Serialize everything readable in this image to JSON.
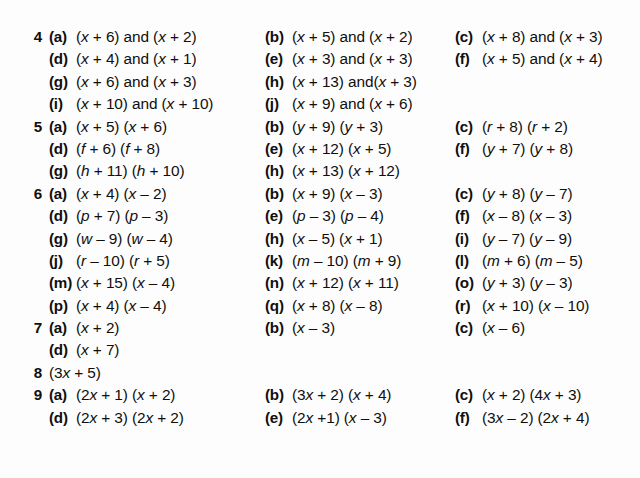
{
  "page": {
    "background": "#fdfdfd",
    "text_color": "#100f0d"
  },
  "rows": [
    {
      "number": "4",
      "cells": [
        {
          "col": 1,
          "label": "(a)",
          "expr": "(x + 6) and (x + 2)"
        },
        {
          "col": 2,
          "label": "(b)",
          "expr": "(x + 5) and (x + 2)"
        },
        {
          "col": 3,
          "label": "(c)",
          "expr": "(x + 8) and (x + 3)"
        }
      ]
    },
    {
      "number": "",
      "cells": [
        {
          "col": 1,
          "label": "(d)",
          "expr": "(x + 4) and (x + 1)"
        },
        {
          "col": 2,
          "label": "(e)",
          "expr": "(x + 3) and (x + 3)"
        },
        {
          "col": 3,
          "label": "(f)",
          "expr": "(x + 5) and (x + 4)"
        }
      ]
    },
    {
      "number": "",
      "cells": [
        {
          "col": 1,
          "label": "(g)",
          "expr": "(x + 6) and (x + 3)"
        },
        {
          "col": 2,
          "label": "(h)",
          "expr": "(x + 13) and(x + 3)"
        }
      ]
    },
    {
      "number": "",
      "cells": [
        {
          "col": 1,
          "label": "(i)",
          "expr": "(x + 10) and (x + 10)"
        },
        {
          "col": 2,
          "label": "(j)",
          "expr": "(x + 9) and (x + 6)"
        }
      ]
    },
    {
      "number": "5",
      "cells": [
        {
          "col": 1,
          "label": "(a)",
          "expr": "(x + 5) (x + 6)"
        },
        {
          "col": 2,
          "label": "(b)",
          "expr": "(y + 9) (y + 3)"
        },
        {
          "col": 3,
          "label": "(c)",
          "expr": "(r + 8) (r + 2)"
        }
      ]
    },
    {
      "number": "",
      "cells": [
        {
          "col": 1,
          "label": "(d)",
          "expr": "(f + 6) (f + 8)"
        },
        {
          "col": 2,
          "label": "(e)",
          "expr": "(x + 12) (x + 5)"
        },
        {
          "col": 3,
          "label": "(f)",
          "expr": "(y + 7) (y + 8)"
        }
      ]
    },
    {
      "number": "",
      "cells": [
        {
          "col": 1,
          "label": "(g)",
          "expr": "(h + 11) (h + 10)"
        },
        {
          "col": 2,
          "label": "(h)",
          "expr": "(x + 13) (x + 12)"
        }
      ]
    },
    {
      "number": "6",
      "cells": [
        {
          "col": 1,
          "label": "(a)",
          "expr": "(x + 4) (x – 2)"
        },
        {
          "col": 2,
          "label": "(b)",
          "expr": "(x + 9) (x – 3)"
        },
        {
          "col": 3,
          "label": "(c)",
          "expr": "(y + 8) (y – 7)"
        }
      ]
    },
    {
      "number": "",
      "cells": [
        {
          "col": 1,
          "label": "(d)",
          "expr": "(p + 7) (p – 3)"
        },
        {
          "col": 2,
          "label": "(e)",
          "expr": "(p – 3) (p – 4)"
        },
        {
          "col": 3,
          "label": "(f)",
          "expr": "(x – 8) (x – 3)"
        }
      ]
    },
    {
      "number": "",
      "cells": [
        {
          "col": 1,
          "label": "(g)",
          "expr": "(w – 9) (w – 4)"
        },
        {
          "col": 2,
          "label": "(h)",
          "expr": "(x – 5) (x + 1)"
        },
        {
          "col": 3,
          "label": "(i)",
          "expr": "(y – 7) (y – 9)"
        }
      ]
    },
    {
      "number": "",
      "cells": [
        {
          "col": 1,
          "label": "(j)",
          "expr": "(r – 10) (r + 5)"
        },
        {
          "col": 2,
          "label": "(k)",
          "expr": "(m – 10) (m + 9)"
        },
        {
          "col": 3,
          "label": "(l)",
          "expr": "(m + 6) (m – 5)"
        }
      ]
    },
    {
      "number": "",
      "cells": [
        {
          "col": 1,
          "label": "(m)",
          "expr": "(x + 15) (x – 4)"
        },
        {
          "col": 2,
          "label": "(n)",
          "expr": "(x + 12) (x + 11)"
        },
        {
          "col": 3,
          "label": "(o)",
          "expr": "(y + 3) (y – 3)"
        }
      ]
    },
    {
      "number": "",
      "cells": [
        {
          "col": 1,
          "label": "(p)",
          "expr": "(x + 4) (x – 4)"
        },
        {
          "col": 2,
          "label": "(q)",
          "expr": "(x + 8) (x – 8)"
        },
        {
          "col": 3,
          "label": "(r)",
          "expr": "(x + 10) (x – 10)"
        }
      ]
    },
    {
      "number": "7",
      "cells": [
        {
          "col": 1,
          "label": "(a)",
          "expr": "(x + 2)"
        },
        {
          "col": 2,
          "label": "(b)",
          "expr": "(x – 3)"
        },
        {
          "col": 3,
          "label": "(c)",
          "expr": "(x – 6)"
        }
      ]
    },
    {
      "number": "",
      "cells": [
        {
          "col": 1,
          "label": "(d)",
          "expr": "(x + 7)"
        }
      ]
    },
    {
      "number": "8",
      "cells": [
        {
          "col": 1,
          "label": "",
          "expr": "(3x + 5)"
        }
      ]
    },
    {
      "number": "9",
      "cells": [
        {
          "col": 1,
          "label": "(a)",
          "expr": "(2x + 1) (x + 2)"
        },
        {
          "col": 2,
          "label": "(b)",
          "expr": "(3x + 2) (x + 4)"
        },
        {
          "col": 3,
          "label": "(c)",
          "expr": "(x + 2) (4x + 3)"
        }
      ]
    },
    {
      "number": "",
      "cells": [
        {
          "col": 1,
          "label": "(d)",
          "expr": "(2x + 3) (2x + 2)"
        },
        {
          "col": 2,
          "label": "(e)",
          "expr": "(2x +1) (x – 3)"
        },
        {
          "col": 3,
          "label": "(f)",
          "expr": "(3x – 2) (2x + 4)"
        }
      ]
    }
  ]
}
